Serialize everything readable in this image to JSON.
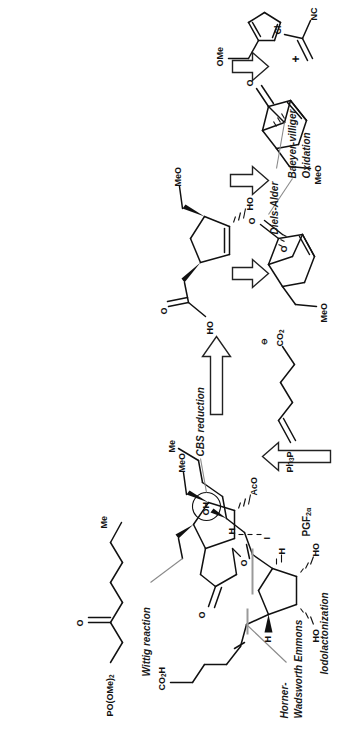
{
  "diagram": {
    "orientation": "rotated-90-ccw",
    "background": "#ffffff",
    "ink": "#111111",
    "leader_color": "#8a8a8a"
  },
  "labels": {
    "horner_wadsworth_line1": "Horner-",
    "horner_wadsworth_line2": "Wadsworth Emmons",
    "wittig": "Wittig reaction",
    "cbs": "CBS reduction",
    "target": "PGF",
    "target_sub": "2α",
    "iodolactonization": "Iodolactonization",
    "baeyer_line1": "Baeyer-villiger",
    "baeyer_line2": "Oxidation",
    "diels_alder": "Diels-Alder",
    "plus": "+"
  },
  "structures": {
    "phosphonate": {
      "name": "dimethyl 2-oxoheptylphosphonate",
      "atoms": [
        "PO(OMe)",
        "Me",
        "O"
      ],
      "po_label": "PO(OMe)",
      "po_sub": "2",
      "me_label": "Me",
      "o_label": "O"
    },
    "iodolactone": {
      "name": "iodolactone intermediate",
      "o_carbonyl": "O",
      "o_ring": "O",
      "iodine": "I",
      "aco": "AcO",
      "meo": "MeO"
    },
    "hydroxy_acid": {
      "name": "cyclopentene hydroxy acid",
      "o_label": "O",
      "ho_acid": "HO",
      "ho_ring": "HO",
      "meo": "MeO"
    },
    "ylide": {
      "name": "Wittig ylide",
      "ph3p": "Ph",
      "ph3p_sub": "3",
      "ph3p_tail": "P",
      "carboxylate": "CO",
      "carboxylate_sub": "2",
      "charge": "⊖"
    },
    "bicyclic_lactone": {
      "name": "bicyclic lactone",
      "o_carbonyl": "O",
      "o_ring": "O",
      "meo": "MeO"
    },
    "bicyclic_ketone": {
      "name": "bicyclo[2.2.1] ketone",
      "o_label": "O",
      "meo": "MeO"
    },
    "diene": {
      "name": "methoxymethyl cyclopentadiene",
      "ome": "OMe"
    },
    "dienophile": {
      "name": "2-chloroacrylonitrile",
      "cl": "Cl",
      "nc": "NC"
    },
    "pgf2a": {
      "name": "PGF2alpha",
      "co2h": "CO",
      "co2h_sub": "2",
      "co2h_tail": "H",
      "me": "Me",
      "oh_circled": "OH",
      "h_left": "H",
      "h_right": "H",
      "ho_left": "HO",
      "ho_right": "HO",
      "h_side": "H"
    }
  },
  "arrows": [
    {
      "id": "arrow-lactone-to-acid",
      "direction": "right",
      "style": "hollow-retrosynthetic"
    },
    {
      "id": "arrow-acid-to-lactone2",
      "direction": "down",
      "style": "hollow-retrosynthetic"
    },
    {
      "id": "arrow-lactone2-to-ketone",
      "direction": "down",
      "style": "hollow-retrosynthetic"
    },
    {
      "id": "arrow-ketone-to-diene",
      "direction": "down",
      "style": "hollow-retrosynthetic"
    },
    {
      "id": "arrow-ylide-up",
      "direction": "up",
      "style": "hollow-retrosynthetic"
    }
  ]
}
